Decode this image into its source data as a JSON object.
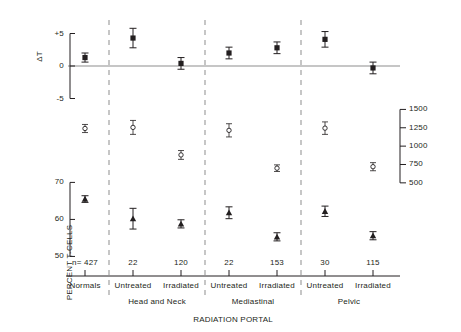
{
  "chart_data": {
    "type": "scatter",
    "title": "",
    "xlabel": "RADIATION  PORTAL",
    "grid": false,
    "legend_position": "none",
    "panels": [
      {
        "name": "delta-t",
        "ylabel": "ΔT",
        "ytick_labels": [
          "+5",
          "0",
          "-5"
        ],
        "ytick_values": [
          5,
          0,
          -5
        ],
        "ylim": [
          -6,
          6
        ],
        "marker": "filled-square",
        "values": [
          1.3,
          4.3,
          0.4,
          2.0,
          2.8,
          4.1,
          -0.3
        ],
        "err_low": [
          0.7,
          1.5,
          0.9,
          0.9,
          0.9,
          1.2,
          0.9
        ],
        "err_high": [
          0.7,
          1.5,
          0.9,
          0.9,
          0.9,
          1.2,
          0.9
        ]
      },
      {
        "name": "total-t-cells",
        "ylabel": "TOTAL  T-CELLS",
        "ytick_labels": [
          "1500",
          "1250",
          "1000",
          "750",
          "500"
        ],
        "ytick_values": [
          1500,
          1250,
          1000,
          750,
          500
        ],
        "ylim": [
          430,
          1560
        ],
        "marker": "open-circle",
        "values": [
          1240,
          1255,
          880,
          1215,
          700,
          1245,
          720
        ],
        "err_low": [
          55,
          95,
          60,
          90,
          45,
          85,
          55
        ],
        "err_high": [
          55,
          95,
          60,
          90,
          45,
          85,
          55
        ]
      },
      {
        "name": "percent-t-cells",
        "ylabel": "PERCENT  T-CELLS",
        "ytick_labels": [
          "70",
          "60",
          "50"
        ],
        "ytick_values": [
          70,
          60,
          50
        ],
        "ylim": [
          48.5,
          72
        ],
        "marker": "filled-triangle",
        "values": [
          65.5,
          60.2,
          58.8,
          61.8,
          55.3,
          62.2,
          55.6
        ],
        "err_low": [
          0.9,
          2.8,
          1.1,
          1.6,
          1.1,
          1.4,
          1.1
        ],
        "err_high": [
          0.9,
          2.8,
          1.1,
          1.6,
          1.1,
          1.4,
          1.1
        ]
      }
    ],
    "categories": [
      {
        "n": "n= 427",
        "label": "Normals",
        "group": ""
      },
      {
        "n": "22",
        "label": "Untreated",
        "group": "Head  and  Neck"
      },
      {
        "n": "120",
        "label": "Irradiated",
        "group": "Head  and  Neck"
      },
      {
        "n": "22",
        "label": "Untreated",
        "group": "Mediastinal"
      },
      {
        "n": "153",
        "label": "Irradiated",
        "group": "Mediastinal"
      },
      {
        "n": "30",
        "label": "Untreated",
        "group": "Pelvic"
      },
      {
        "n": "115",
        "label": "Irradiated",
        "group": "Pelvic"
      }
    ],
    "group_labels": [
      {
        "text": "Head  and  Neck",
        "center_index": 1.5
      },
      {
        "text": "Mediastinal",
        "center_index": 3.5
      },
      {
        "text": "Pelvic",
        "center_index": 5.5
      }
    ]
  }
}
